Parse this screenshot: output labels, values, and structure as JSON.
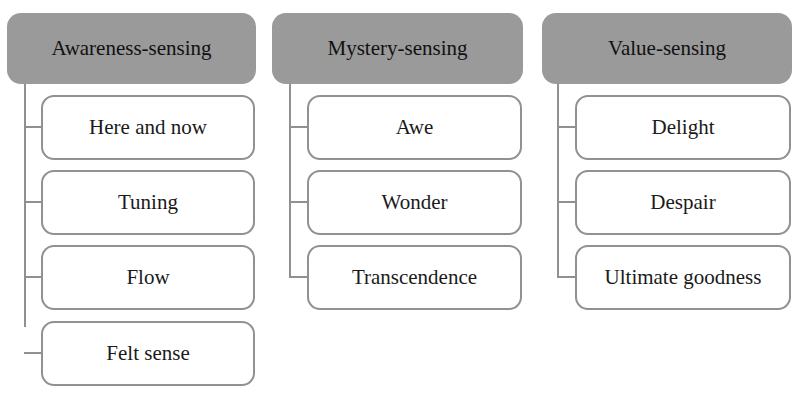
{
  "diagram": {
    "type": "hierarchy",
    "colors": {
      "header_fill": "#9a9a9a",
      "child_border": "#919191",
      "connector": "#909090",
      "child_fill": "#ffffff"
    },
    "columns": [
      {
        "title": "Awareness-sensing",
        "children": [
          "Here and now",
          "Tuning",
          "Flow",
          "Felt sense"
        ]
      },
      {
        "title": "Mystery-sensing",
        "children": [
          "Awe",
          "Wonder",
          "Transcendence"
        ]
      },
      {
        "title": "Value-sensing",
        "children": [
          "Delight",
          "Despair",
          "Ultimate goodness"
        ]
      }
    ]
  }
}
